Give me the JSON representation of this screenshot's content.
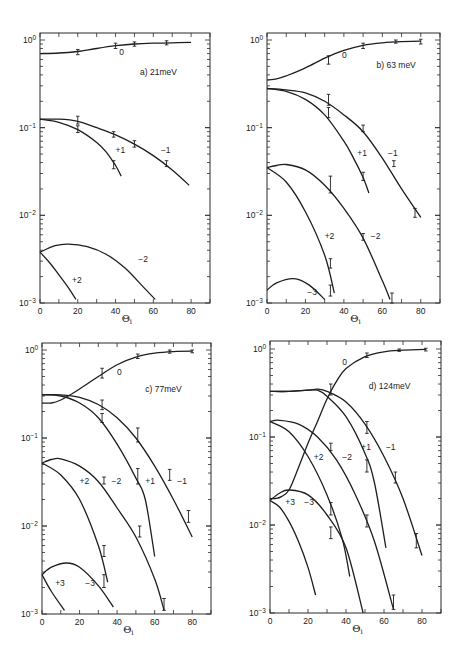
{
  "chart_data": [
    {
      "type": "line",
      "panel": "a",
      "title": "a)  21meV",
      "xlabel": "Θi",
      "ylabel": "",
      "yscale": "log",
      "xlim": [
        0,
        90
      ],
      "ylim": [
        0.001,
        1
      ],
      "xticks": [
        "0",
        "20",
        "40",
        "60",
        "80"
      ],
      "yticks": [
        "10^0",
        "10^-1",
        "10^-2",
        "10^-3"
      ],
      "frame": {
        "x0": 40,
        "x1": 210,
        "y_top": 33,
        "y_bottom": 303,
        "y_dec0": 40
      },
      "series": [
        {
          "name": "0",
          "x": [
            0,
            10,
            20,
            30,
            40,
            50,
            60,
            70,
            80
          ],
          "y": [
            0.7,
            0.71,
            0.74,
            0.8,
            0.86,
            0.9,
            0.92,
            0.93,
            0.94
          ]
        },
        {
          "name": "-1",
          "x": [
            0,
            10,
            20,
            30,
            40,
            50,
            60,
            70,
            79
          ],
          "y": [
            0.125,
            0.125,
            0.118,
            0.1,
            0.083,
            0.065,
            0.048,
            0.033,
            0.022
          ]
        },
        {
          "name": "+1",
          "x": [
            0,
            10,
            20,
            30,
            35,
            40,
            43
          ],
          "y": [
            0.125,
            0.115,
            0.095,
            0.068,
            0.053,
            0.037,
            0.028
          ]
        },
        {
          "name": "-2",
          "x": [
            0,
            8,
            15,
            25,
            35,
            45,
            55,
            61
          ],
          "y": [
            0.0038,
            0.0045,
            0.0047,
            0.0044,
            0.0036,
            0.0025,
            0.0015,
            0.0011
          ]
        },
        {
          "name": "+2",
          "x": [
            0,
            5,
            10,
            15,
            19
          ],
          "y": [
            0.0038,
            0.0029,
            0.0021,
            0.0015,
            0.0011
          ]
        }
      ],
      "errorbars": [
        {
          "x": 20,
          "lo": 0.68,
          "hi": 0.78
        },
        {
          "x": 40,
          "lo": 0.8,
          "hi": 0.92
        },
        {
          "x": 50,
          "lo": 0.85,
          "hi": 0.95
        },
        {
          "x": 67,
          "lo": 0.88,
          "hi": 0.98
        },
        {
          "x": 20,
          "lo": 0.11,
          "hi": 0.135
        },
        {
          "x": 20,
          "lo": 0.088,
          "hi": 0.105
        },
        {
          "x": 39,
          "lo": 0.078,
          "hi": 0.09
        },
        {
          "x": 50,
          "lo": 0.06,
          "hi": 0.071
        },
        {
          "x": 39,
          "lo": 0.034,
          "hi": 0.042
        },
        {
          "x": 67,
          "lo": 0.036,
          "hi": 0.042
        }
      ],
      "annotations": [
        {
          "text": "0",
          "x": 42,
          "y": 0.68
        },
        {
          "text": "+1",
          "x": 40,
          "y": 0.052
        },
        {
          "text": "-1",
          "x": 64,
          "y": 0.052
        },
        {
          "text": "-2",
          "x": 52,
          "y": 0.0029
        },
        {
          "text": "+2",
          "x": 17,
          "y": 0.0017
        }
      ],
      "title_pos": {
        "x": 53,
        "y": 0.4
      }
    },
    {
      "type": "line",
      "panel": "b",
      "title": "b)  63 meV",
      "xlabel": "Θi",
      "ylabel": "",
      "yscale": "log",
      "xlim": [
        0,
        90
      ],
      "ylim": [
        0.001,
        1
      ],
      "xticks": [
        "0",
        "20",
        "40",
        "60",
        "80"
      ],
      "yticks": [
        "10^0",
        "10^-1",
        "10^-2",
        "10^-3"
      ],
      "frame": {
        "x0": 267,
        "x1": 440,
        "y_top": 33,
        "y_bottom": 303,
        "y_dec0": 40
      },
      "series": [
        {
          "name": "0",
          "x": [
            0,
            5,
            10,
            20,
            30,
            40,
            50,
            60,
            70,
            80
          ],
          "y": [
            0.35,
            0.36,
            0.39,
            0.48,
            0.62,
            0.76,
            0.87,
            0.93,
            0.96,
            0.97
          ]
        },
        {
          "name": "-1",
          "x": [
            0,
            10,
            20,
            30,
            40,
            50,
            60,
            70,
            80
          ],
          "y": [
            0.28,
            0.27,
            0.25,
            0.2,
            0.14,
            0.09,
            0.045,
            0.02,
            0.0095
          ]
        },
        {
          "name": "+1",
          "x": [
            0,
            10,
            20,
            30,
            40,
            45,
            50,
            53
          ],
          "y": [
            0.28,
            0.26,
            0.21,
            0.14,
            0.07,
            0.045,
            0.027,
            0.018
          ]
        },
        {
          "name": "-2",
          "x": [
            0,
            5,
            10,
            20,
            30,
            40,
            50,
            60,
            64
          ],
          "y": [
            0.035,
            0.037,
            0.038,
            0.033,
            0.022,
            0.012,
            0.0055,
            0.0018,
            0.0011
          ]
        },
        {
          "name": "+2",
          "x": [
            0,
            10,
            20,
            30,
            35
          ],
          "y": [
            0.035,
            0.024,
            0.011,
            0.0035,
            0.0013
          ]
        },
        {
          "name": "-3",
          "x": [
            0,
            5,
            14,
            22,
            30
          ],
          "y": [
            0.0014,
            0.0017,
            0.0019,
            0.0016,
            0.0011
          ]
        }
      ],
      "errorbars": [
        {
          "x": 32,
          "lo": 0.53,
          "hi": 0.66
        },
        {
          "x": 50,
          "lo": 0.8,
          "hi": 0.92
        },
        {
          "x": 67,
          "lo": 0.92,
          "hi": 1.0
        },
        {
          "x": 80,
          "lo": 0.9,
          "hi": 1.02
        },
        {
          "x": 32,
          "lo": 0.18,
          "hi": 0.24
        },
        {
          "x": 32,
          "lo": 0.13,
          "hi": 0.17
        },
        {
          "x": 50,
          "lo": 0.09,
          "hi": 0.107
        },
        {
          "x": 50,
          "lo": 0.025,
          "hi": 0.031
        },
        {
          "x": 66,
          "lo": 0.036,
          "hi": 0.042
        },
        {
          "x": 77,
          "lo": 0.0095,
          "hi": 0.012
        },
        {
          "x": 33,
          "lo": 0.018,
          "hi": 0.028
        },
        {
          "x": 50,
          "lo": 0.0052,
          "hi": 0.0062
        },
        {
          "x": 33,
          "lo": 0.0025,
          "hi": 0.0032
        },
        {
          "x": 33,
          "lo": 0.0012,
          "hi": 0.0016
        },
        {
          "x": 65,
          "lo": 0.001,
          "hi": 0.0013
        }
      ],
      "annotations": [
        {
          "text": "0",
          "x": 39,
          "y": 0.62
        },
        {
          "text": "+1",
          "x": 47,
          "y": 0.047
        },
        {
          "text": "-1",
          "x": 63,
          "y": 0.047
        },
        {
          "text": "+2",
          "x": 30,
          "y": 0.0054
        },
        {
          "text": "-2",
          "x": 54,
          "y": 0.0054
        },
        {
          "text": "-3",
          "x": 21,
          "y": 0.00125
        }
      ],
      "title_pos": {
        "x": 57,
        "y": 0.48
      }
    },
    {
      "type": "line",
      "panel": "c",
      "title": "c)   77meV",
      "xlabel": "Θi",
      "ylabel": "",
      "yscale": "log",
      "xlim": [
        0,
        90
      ],
      "ylim": [
        0.001,
        1
      ],
      "xticks": [
        "0",
        "20",
        "40",
        "60",
        "80"
      ],
      "yticks": [
        "10^0",
        "10^-1",
        "10^-2",
        "10^-3"
      ],
      "frame": {
        "x0": 42,
        "x1": 211,
        "y_top": 343,
        "y_bottom": 614,
        "y_dec0": 350
      },
      "series": [
        {
          "name": "0",
          "x": [
            0,
            5,
            10,
            15,
            20,
            30,
            40,
            50,
            60,
            70,
            80
          ],
          "y": [
            0.25,
            0.25,
            0.27,
            0.31,
            0.36,
            0.5,
            0.68,
            0.83,
            0.92,
            0.96,
            0.97
          ]
        },
        {
          "name": "-1",
          "x": [
            0,
            10,
            20,
            30,
            40,
            50,
            60,
            70,
            80
          ],
          "y": [
            0.31,
            0.31,
            0.29,
            0.24,
            0.17,
            0.1,
            0.048,
            0.02,
            0.0075
          ]
        },
        {
          "name": "+1",
          "x": [
            0,
            10,
            20,
            30,
            40,
            50,
            55,
            60
          ],
          "y": [
            0.31,
            0.3,
            0.25,
            0.17,
            0.085,
            0.035,
            0.02,
            0.0045
          ]
        },
        {
          "name": "-2",
          "x": [
            0,
            5,
            10,
            20,
            30,
            40,
            50,
            60,
            65
          ],
          "y": [
            0.052,
            0.057,
            0.058,
            0.048,
            0.032,
            0.016,
            0.0075,
            0.0025,
            0.0011
          ]
        },
        {
          "name": "+2",
          "x": [
            0,
            10,
            20,
            30,
            35
          ],
          "y": [
            0.052,
            0.038,
            0.02,
            0.006,
            0.0023
          ]
        },
        {
          "name": "-3",
          "x": [
            0,
            5,
            13,
            20,
            30,
            38
          ],
          "y": [
            0.0028,
            0.0034,
            0.0038,
            0.0034,
            0.0021,
            0.0012
          ]
        },
        {
          "name": "+3",
          "x": [
            0,
            5,
            12
          ],
          "y": [
            0.0028,
            0.0018,
            0.0011
          ]
        }
      ],
      "errorbars": [
        {
          "x": 32,
          "lo": 0.48,
          "hi": 0.62
        },
        {
          "x": 51,
          "lo": 0.8,
          "hi": 0.9
        },
        {
          "x": 68,
          "lo": 0.92,
          "hi": 1.0
        },
        {
          "x": 80,
          "lo": 0.93,
          "hi": 1.0
        },
        {
          "x": 32,
          "lo": 0.21,
          "hi": 0.27
        },
        {
          "x": 32,
          "lo": 0.15,
          "hi": 0.19
        },
        {
          "x": 51,
          "lo": 0.09,
          "hi": 0.13
        },
        {
          "x": 51,
          "lo": 0.03,
          "hi": 0.045
        },
        {
          "x": 68,
          "lo": 0.033,
          "hi": 0.044
        },
        {
          "x": 78,
          "lo": 0.011,
          "hi": 0.015
        },
        {
          "x": 33,
          "lo": 0.03,
          "hi": 0.036
        },
        {
          "x": 52,
          "lo": 0.0075,
          "hi": 0.01
        },
        {
          "x": 33,
          "lo": 0.0045,
          "hi": 0.006
        },
        {
          "x": 33,
          "lo": 0.002,
          "hi": 0.0028
        },
        {
          "x": 65,
          "lo": 0.0011,
          "hi": 0.0015
        }
      ],
      "annotations": [
        {
          "text": "0",
          "x": 40,
          "y": 0.52
        },
        {
          "text": "+2",
          "x": 20,
          "y": 0.03
        },
        {
          "text": "-2",
          "x": 37,
          "y": 0.03
        },
        {
          "text": "+1",
          "x": 55,
          "y": 0.03
        },
        {
          "text": "-1",
          "x": 72,
          "y": 0.03
        },
        {
          "text": "+3",
          "x": 7,
          "y": 0.0021
        },
        {
          "text": "-3",
          "x": 23,
          "y": 0.0021
        }
      ],
      "title_pos": {
        "x": 55,
        "y": 0.33
      }
    },
    {
      "type": "line",
      "panel": "d",
      "title": "d)  124meV",
      "xlabel": "Θi",
      "ylabel": "",
      "yscale": "log",
      "xlim": [
        0,
        90
      ],
      "ylim": [
        0.001,
        1
      ],
      "xticks": [
        "0",
        "20",
        "40",
        "60",
        "80"
      ],
      "yticks": [
        "10^0",
        "10^-1",
        "10^-2",
        "10^-3"
      ],
      "frame": {
        "x0": 270,
        "x1": 441,
        "y_top": 341,
        "y_bottom": 613,
        "y_dec0": 349
      },
      "series": [
        {
          "name": "0",
          "x": [
            0,
            3,
            6,
            10,
            15,
            20,
            25,
            30,
            35,
            40,
            50,
            60,
            70,
            82
          ],
          "y": [
            0.02,
            0.02,
            0.021,
            0.025,
            0.045,
            0.085,
            0.15,
            0.27,
            0.43,
            0.6,
            0.82,
            0.93,
            0.97,
            0.99
          ]
        },
        {
          "name": "-1",
          "x": [
            0,
            10,
            20,
            25,
            30,
            40,
            50,
            60,
            70,
            80
          ],
          "y": [
            0.33,
            0.33,
            0.34,
            0.35,
            0.33,
            0.25,
            0.14,
            0.06,
            0.02,
            0.0045
          ]
        },
        {
          "name": "+1",
          "x": [
            0,
            10,
            20,
            25,
            30,
            40,
            50,
            55,
            61
          ],
          "y": [
            0.33,
            0.33,
            0.34,
            0.34,
            0.29,
            0.17,
            0.065,
            0.03,
            0.0055
          ]
        },
        {
          "name": "-2",
          "x": [
            0,
            5,
            15,
            25,
            35,
            45,
            55,
            65
          ],
          "y": [
            0.15,
            0.155,
            0.14,
            0.1,
            0.055,
            0.022,
            0.0065,
            0.0011
          ]
        },
        {
          "name": "+2",
          "x": [
            0,
            10,
            20,
            30,
            38,
            42
          ],
          "y": [
            0.15,
            0.115,
            0.06,
            0.022,
            0.007,
            0.0026
          ]
        },
        {
          "name": "-3",
          "x": [
            0,
            5,
            10,
            20,
            30,
            40,
            49
          ],
          "y": [
            0.019,
            0.023,
            0.025,
            0.022,
            0.013,
            0.0055,
            0.001
          ]
        },
        {
          "name": "+3",
          "x": [
            0,
            5,
            10,
            15,
            20,
            24
          ],
          "y": [
            0.019,
            0.016,
            0.011,
            0.0065,
            0.0033,
            0.0016
          ]
        }
      ],
      "errorbars": [
        {
          "x": 32,
          "lo": 0.3,
          "hi": 0.4
        },
        {
          "x": 51,
          "lo": 0.8,
          "hi": 0.9
        },
        {
          "x": 68,
          "lo": 0.94,
          "hi": 1.0
        },
        {
          "x": 82,
          "lo": 0.95,
          "hi": 1.02
        },
        {
          "x": 32,
          "lo": 0.07,
          "hi": 0.085
        },
        {
          "x": 51,
          "lo": 0.11,
          "hi": 0.15
        },
        {
          "x": 51,
          "lo": 0.04,
          "hi": 0.055
        },
        {
          "x": 66,
          "lo": 0.03,
          "hi": 0.04
        },
        {
          "x": 32,
          "lo": 0.013,
          "hi": 0.018
        },
        {
          "x": 51,
          "lo": 0.0095,
          "hi": 0.013
        },
        {
          "x": 32,
          "lo": 0.007,
          "hi": 0.0095
        },
        {
          "x": 77,
          "lo": 0.0055,
          "hi": 0.008
        },
        {
          "x": 65,
          "lo": 0.0011,
          "hi": 0.0016
        }
      ],
      "annotations": [
        {
          "text": "0",
          "x": 38,
          "y": 0.65
        },
        {
          "text": "+1",
          "x": 48,
          "y": 0.072
        },
        {
          "text": "-1",
          "x": 61,
          "y": 0.072
        },
        {
          "text": "+2",
          "x": 23,
          "y": 0.055
        },
        {
          "text": "-2",
          "x": 38,
          "y": 0.055
        },
        {
          "text": "+3",
          "x": 8,
          "y": 0.017
        },
        {
          "text": "-3",
          "x": 18,
          "y": 0.017
        }
      ],
      "title_pos": {
        "x": 52,
        "y": 0.35
      }
    }
  ]
}
